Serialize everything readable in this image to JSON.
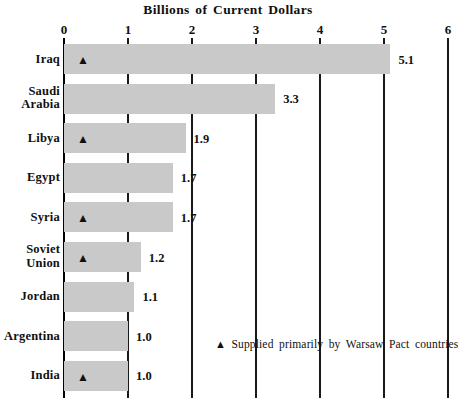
{
  "chart_data": {
    "type": "bar",
    "orientation": "horizontal",
    "title": "Billions of Current Dollars",
    "xlabel": "",
    "ylabel": "",
    "xlim": [
      0,
      6
    ],
    "xticks": [
      "0",
      "1",
      "2",
      "3",
      "4",
      "5",
      "6"
    ],
    "grid": "vertical",
    "legend_position": "inside-bottom-right",
    "categories": [
      "Iraq",
      "Saudi Arabia",
      "Libya",
      "Egypt",
      "Syria",
      "Soviet Union",
      "Jordan",
      "Argentina",
      "India"
    ],
    "values": [
      5.1,
      3.3,
      1.9,
      1.7,
      1.7,
      1.2,
      1.1,
      1.0,
      1.0
    ],
    "value_labels": [
      "5.1",
      "3.3",
      "1.9",
      "1.7",
      "1.7",
      "1.2",
      "1.1",
      "1.0",
      "1.0"
    ],
    "marker_flags": [
      true,
      false,
      true,
      false,
      true,
      true,
      false,
      false,
      true
    ],
    "marker_glyph": "▲",
    "legend": [
      {
        "glyph": "▲",
        "label": "Supplied primarily by Warsaw Pact countries"
      }
    ],
    "colors": {
      "bar_fill": "#c9c9c9",
      "gridline": "#1a1a1a",
      "axis": "#000000",
      "text": "#101010",
      "background": "#ffffff"
    },
    "rows": [
      {
        "label_line1": "Iraq",
        "label_line2": "",
        "value": 5.1,
        "value_label": "5.1",
        "marker": true
      },
      {
        "label_line1": "Saudi",
        "label_line2": "Arabia",
        "value": 3.3,
        "value_label": "3.3",
        "marker": false
      },
      {
        "label_line1": "Libya",
        "label_line2": "",
        "value": 1.9,
        "value_label": "1.9",
        "marker": true
      },
      {
        "label_line1": "Egypt",
        "label_line2": "",
        "value": 1.7,
        "value_label": "1.7",
        "marker": false
      },
      {
        "label_line1": "Syria",
        "label_line2": "",
        "value": 1.7,
        "value_label": "1.7",
        "marker": true
      },
      {
        "label_line1": "Soviet",
        "label_line2": "Union",
        "value": 1.2,
        "value_label": "1.2",
        "marker": true
      },
      {
        "label_line1": "Jordan",
        "label_line2": "",
        "value": 1.1,
        "value_label": "1.1",
        "marker": false
      },
      {
        "label_line1": "Argentina",
        "label_line2": "",
        "value": 1.0,
        "value_label": "1.0",
        "marker": false
      },
      {
        "label_line1": "India",
        "label_line2": "",
        "value": 1.0,
        "value_label": "1.0",
        "marker": true
      }
    ]
  }
}
